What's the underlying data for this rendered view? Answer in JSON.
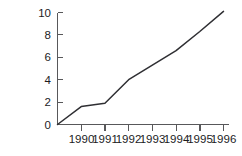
{
  "chart_data": {
    "type": "line",
    "title": "",
    "subtitle": "",
    "xlabel": "",
    "ylabel": "",
    "grid": false,
    "legend": null,
    "legend_position": "none",
    "xlim": [
      1989.0,
      1996.0
    ],
    "ylim": [
      0,
      10
    ],
    "x_tick_labels": [
      "1990",
      "1991",
      "1992",
      "1993",
      "1994",
      "1995",
      "1996"
    ],
    "x_ticks": [
      1990,
      1991,
      1992,
      1993,
      1994,
      1995,
      1996
    ],
    "y_tick_labels": [
      "0",
      "2",
      "4",
      "6",
      "8",
      "10"
    ],
    "y_ticks": [
      0,
      2,
      4,
      6,
      8,
      10
    ],
    "series": [
      {
        "name": "series-1",
        "color": "#2f2f33",
        "x": [
          1989.0,
          1990.0,
          1991.0,
          1992.0,
          1993.0,
          1994.0,
          1995.0,
          1996.0
        ],
        "values": [
          0.0,
          1.6,
          1.9,
          4.0,
          5.3,
          6.6,
          8.3,
          10.1
        ]
      }
    ]
  },
  "axes": {
    "y_axis_name": "y-axis",
    "x_axis_name": "x-axis",
    "axis_color": "#58585a"
  }
}
